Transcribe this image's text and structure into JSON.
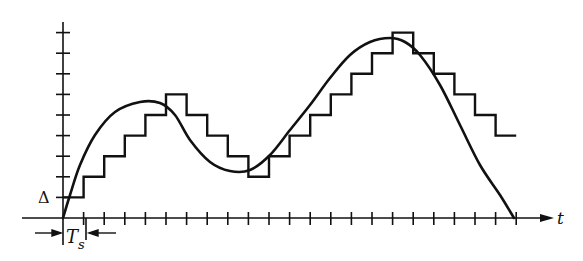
{
  "diagram": {
    "labels": {
      "delta": "Δ",
      "ts_main": "T",
      "ts_sub": "s",
      "t_axis": "t"
    },
    "colors": {
      "ink": "#111111",
      "background": "#ffffff"
    },
    "grid": {
      "origin_x": 63,
      "origin_y": 218,
      "step_px": 20.6,
      "delta_px": 20.6
    },
    "y_ticks": 9,
    "x_ticks": 22,
    "staircase_levels": [
      1,
      2,
      3,
      4,
      5,
      6,
      5,
      4,
      3,
      2,
      3,
      4,
      5,
      6,
      7,
      8,
      9,
      8,
      7,
      6,
      5,
      4
    ],
    "curve_points": [
      [
        63,
        218
      ],
      [
        70,
        195
      ],
      [
        80,
        165
      ],
      [
        95,
        135
      ],
      [
        115,
        112
      ],
      [
        140,
        102
      ],
      [
        160,
        103
      ],
      [
        175,
        115
      ],
      [
        190,
        140
      ],
      [
        210,
        162
      ],
      [
        230,
        171
      ],
      [
        250,
        170
      ],
      [
        270,
        155
      ],
      [
        290,
        130
      ],
      [
        310,
        105
      ],
      [
        330,
        78
      ],
      [
        350,
        55
      ],
      [
        370,
        42
      ],
      [
        390,
        38
      ],
      [
        405,
        42
      ],
      [
        420,
        55
      ],
      [
        440,
        85
      ],
      [
        460,
        125
      ],
      [
        480,
        165
      ],
      [
        500,
        195
      ],
      [
        514,
        218
      ]
    ]
  }
}
